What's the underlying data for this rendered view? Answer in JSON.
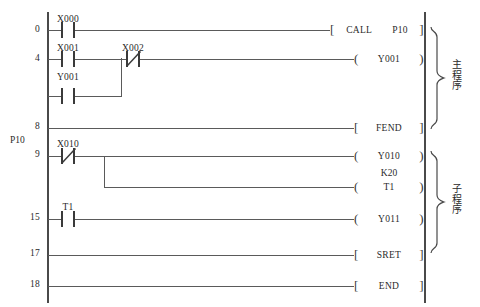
{
  "diagram": {
    "type": "plc-ladder-logic",
    "left_rail_label": "",
    "pointer_label": "P10",
    "rungs": [
      {
        "step": "0",
        "contacts": [
          {
            "name": "X000",
            "type": "no"
          }
        ],
        "output": {
          "style": "bracket",
          "op": "CALL",
          "arg": "P10"
        }
      },
      {
        "step": "4",
        "contacts": [
          {
            "name": "X001",
            "type": "no"
          },
          {
            "name": "Y001",
            "type": "no"
          },
          {
            "name": "X002",
            "type": "nc"
          }
        ],
        "output": {
          "style": "paren",
          "op": "Y001",
          "arg": ""
        }
      },
      {
        "step": "8",
        "contacts": [],
        "output": {
          "style": "bracket",
          "op": "FEND",
          "arg": ""
        }
      },
      {
        "step": "9",
        "contacts": [
          {
            "name": "X010",
            "type": "nc"
          }
        ],
        "output": {
          "style": "paren",
          "op": "Y010",
          "arg": ""
        }
      },
      {
        "step": "",
        "contacts": [],
        "output": {
          "style": "paren",
          "op": "T1",
          "arg": "",
          "top_label": "K20"
        }
      },
      {
        "step": "15",
        "contacts": [
          {
            "name": "T1",
            "type": "no"
          }
        ],
        "output": {
          "style": "paren",
          "op": "Y011",
          "arg": ""
        }
      },
      {
        "step": "17",
        "contacts": [],
        "output": {
          "style": "bracket",
          "op": "SRET",
          "arg": ""
        }
      },
      {
        "step": "18",
        "contacts": [],
        "output": {
          "style": "bracket",
          "op": "END",
          "arg": ""
        }
      }
    ],
    "groups": [
      {
        "name": "main-program",
        "label": [
          "主",
          "程",
          "序"
        ]
      },
      {
        "name": "subroutine",
        "label": [
          "子",
          "程",
          "序"
        ]
      }
    ]
  },
  "labels": {
    "step_0": "0",
    "step_4": "4",
    "step_8": "8",
    "step_9": "9",
    "step_15": "15",
    "step_17": "17",
    "step_18": "18",
    "p10": "P10",
    "x000": "X000",
    "x001": "X001",
    "y001_contact": "Y001",
    "x002": "X002",
    "x010": "X010",
    "t1_contact": "T1",
    "call_op": "CALL",
    "call_arg": "P10",
    "y001_coil": "Y001",
    "fend": "FEND",
    "y010_coil": "Y010",
    "k20": "K20",
    "t1_coil": "T1",
    "y011_coil": "Y011",
    "sret": "SRET",
    "end": "END",
    "main_1": "主",
    "main_2": "程",
    "main_3": "序",
    "sub_1": "子",
    "sub_2": "程",
    "sub_3": "序"
  },
  "colors": {
    "rail": "#4a4a4a",
    "wire": "#5a5a5a",
    "text": "#2a2a2a",
    "background": "#ffffff"
  }
}
